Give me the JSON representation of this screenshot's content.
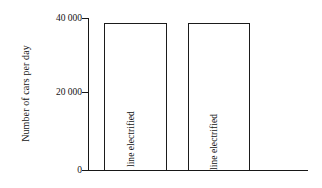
{
  "chart_data": {
    "type": "bar",
    "title": "",
    "subtitle": "",
    "xlabel": "",
    "ylabel": "Number of cars per day",
    "categories": [
      "Before rail line electrified",
      "After rail line electrified"
    ],
    "values": [
      38700,
      38700
    ],
    "ylim": [
      0,
      40000
    ],
    "yticks": [
      0,
      20000,
      40000
    ],
    "ytick_labels": [
      "0",
      "20 000",
      "40 000"
    ],
    "grid": false,
    "legend": null,
    "bar_fill_color": "#ffffff",
    "bar_edge_color": "#1b1b1b",
    "axis_color": "#171717",
    "background_color": "#ffffff",
    "annotations": []
  },
  "axis": {
    "y_title": "Number of cars per day",
    "ticks": [
      {
        "label": "40 000",
        "value": 40000
      },
      {
        "label": "20 000",
        "value": 20000
      },
      {
        "label": "0",
        "value": 0
      }
    ]
  },
  "bars": [
    {
      "label": "Before rail line electrified",
      "value": 38700
    },
    {
      "label": "After rail line electrified",
      "value": 38700
    }
  ]
}
